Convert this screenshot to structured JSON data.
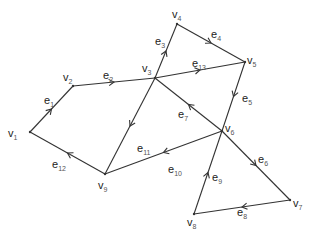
{
  "diagram": {
    "type": "directed-graph",
    "vertices": [
      {
        "id": "v1",
        "label": "v",
        "sub": "1",
        "x": 30,
        "y": 132,
        "lx": 8,
        "ly": 137
      },
      {
        "id": "v2",
        "label": "v",
        "sub": "2",
        "x": 73,
        "y": 86,
        "lx": 63,
        "ly": 81
      },
      {
        "id": "v3",
        "label": "v",
        "sub": "3",
        "x": 155,
        "y": 78,
        "lx": 142,
        "ly": 72
      },
      {
        "id": "v4",
        "label": "v",
        "sub": "4",
        "x": 177,
        "y": 24,
        "lx": 172,
        "ly": 18
      },
      {
        "id": "v5",
        "label": "v",
        "sub": "5",
        "x": 245,
        "y": 62,
        "lx": 247,
        "ly": 64
      },
      {
        "id": "v6",
        "label": "v",
        "sub": "6",
        "x": 222,
        "y": 131,
        "lx": 225,
        "ly": 132
      },
      {
        "id": "v7",
        "label": "v",
        "sub": "7",
        "x": 290,
        "y": 200,
        "lx": 293,
        "ly": 207
      },
      {
        "id": "v8",
        "label": "v",
        "sub": "8",
        "x": 194,
        "y": 214,
        "lx": 187,
        "ly": 226
      },
      {
        "id": "v9",
        "label": "v",
        "sub": "9",
        "x": 105,
        "y": 174,
        "lx": 98,
        "ly": 189
      }
    ],
    "edges": [
      {
        "id": "e1",
        "label": "e",
        "sub": "1",
        "from": "v1",
        "to": "v2",
        "lx": 44,
        "ly": 104
      },
      {
        "id": "e2",
        "label": "e",
        "sub": "2",
        "from": "v2",
        "to": "v3",
        "lx": 103,
        "ly": 79
      },
      {
        "id": "e3",
        "label": "e",
        "sub": "3",
        "from": "v3",
        "to": "v4",
        "lx": 155,
        "ly": 45
      },
      {
        "id": "e4",
        "label": "e",
        "sub": "4",
        "from": "v4",
        "to": "v5",
        "lx": 211,
        "ly": 38
      },
      {
        "id": "e5",
        "label": "e",
        "sub": "5",
        "from": "v5",
        "to": "v6",
        "lx": 242,
        "ly": 102
      },
      {
        "id": "e6",
        "label": "e",
        "sub": "6",
        "from": "v6",
        "to": "v7",
        "lx": 258,
        "ly": 163
      },
      {
        "id": "e7",
        "label": "e",
        "sub": "7",
        "from": "v6",
        "to": "v3",
        "lx": 178,
        "ly": 118
      },
      {
        "id": "e8",
        "label": "e",
        "sub": "8",
        "from": "v7",
        "to": "v8",
        "lx": 237,
        "ly": 216
      },
      {
        "id": "e9",
        "label": "e",
        "sub": "9",
        "from": "v8",
        "to": "v6",
        "lx": 212,
        "ly": 181
      },
      {
        "id": "e10",
        "label": "e",
        "sub": "10",
        "from": "v6",
        "to": "v9",
        "lx": 168,
        "ly": 173
      },
      {
        "id": "e11",
        "label": "e",
        "sub": "11",
        "from": "v3",
        "to": "v9",
        "lx": 137,
        "ly": 152
      },
      {
        "id": "e12",
        "label": "e",
        "sub": "12",
        "from": "v9",
        "to": "v1",
        "lx": 52,
        "ly": 168
      },
      {
        "id": "e13",
        "label": "e",
        "sub": "13",
        "from": "v3",
        "to": "v5",
        "lx": 192,
        "ly": 67
      }
    ]
  }
}
